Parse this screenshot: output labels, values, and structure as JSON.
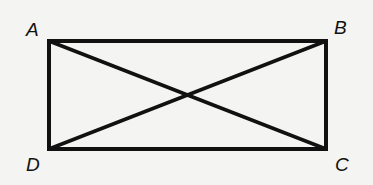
{
  "diagram": {
    "vertices": {
      "A": {
        "label": "A",
        "x": 49,
        "y": 41
      },
      "B": {
        "label": "B",
        "x": 326,
        "y": 41
      },
      "C": {
        "label": "C",
        "x": 326,
        "y": 149
      },
      "D": {
        "label": "D",
        "x": 49,
        "y": 149
      }
    },
    "diagonals": [
      "AC",
      "BD"
    ],
    "colors": {
      "stroke": "#111111",
      "background": "#f4f4f2"
    }
  }
}
